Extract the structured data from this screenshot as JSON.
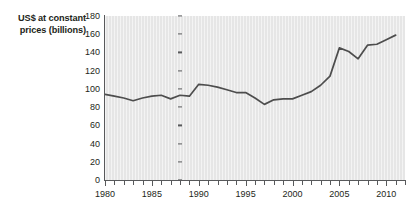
{
  "chart_data": {
    "type": "line",
    "title": "",
    "xlabel": "",
    "ylabel": "US$ at constant prices (billions)",
    "ylim": [
      0,
      180
    ],
    "xlim": [
      1980,
      2012
    ],
    "ytick_step": 20,
    "grid": false,
    "legend": "none",
    "line_color": "#4d4d4d",
    "plot_background": "#e6e6e6",
    "x": [
      1980,
      1981,
      1982,
      1983,
      1984,
      1985,
      1986,
      1987,
      1988,
      1989,
      1990,
      1991,
      1992,
      1993,
      1994,
      1995,
      1996,
      1997,
      1998,
      1999,
      2000,
      2001,
      2002,
      2003,
      2004,
      2005,
      2006,
      2007,
      2008,
      2009,
      2010,
      2011
    ],
    "values": [
      94,
      92,
      90,
      87,
      90,
      92,
      93,
      89,
      93,
      92,
      105,
      104,
      102,
      99,
      96,
      96,
      90,
      83,
      88,
      89,
      89,
      93,
      97,
      104,
      114,
      145,
      141,
      133,
      148,
      149,
      154,
      159
    ],
    "categories": [
      "1980",
      "1981",
      "1982",
      "1983",
      "1984",
      "1985",
      "1986",
      "1987",
      "1988",
      "1989",
      "1990",
      "1991",
      "1992",
      "1993",
      "1994",
      "1995",
      "1996",
      "1997",
      "1998",
      "1999",
      "2000",
      "2001",
      "2002",
      "2003",
      "2004",
      "2005",
      "2006",
      "2007",
      "2008",
      "2009",
      "2010",
      "2011"
    ],
    "ytick_labels": [
      "180",
      "160",
      "140",
      "120",
      "100",
      "80",
      "60",
      "40",
      "20",
      "0"
    ],
    "ytick_values": [
      180,
      160,
      140,
      120,
      100,
      80,
      60,
      40,
      20,
      0
    ],
    "xtick_labels": [
      "1980",
      "1985",
      "1990",
      "1995",
      "2000",
      "2005",
      "2010"
    ],
    "xtick_values": [
      1980,
      1985,
      1990,
      1995,
      2000,
      2005,
      2010
    ],
    "xtick_minor_values": [
      1981,
      1982,
      1983,
      1984,
      1986,
      1987,
      1988,
      1989,
      1991,
      1992,
      1993,
      1994,
      1996,
      1997,
      1998,
      1999,
      2001,
      2002,
      2003,
      2004,
      2006,
      2007,
      2008,
      2009,
      2011,
      2012
    ]
  },
  "axis": {
    "y_title_line1": "US$ at constant",
    "y_title_line2": "prices (billions)"
  },
  "header": {
    "cropped_title": ""
  }
}
